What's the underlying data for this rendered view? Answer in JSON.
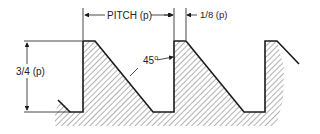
{
  "diagram": {
    "labels": {
      "pitch": "PITCH (p)",
      "flat": "1/8 (p)",
      "depth": "3/4 (p)",
      "angle": "45",
      "angle_unit": "o"
    },
    "geometry": {
      "pitch_px": 91,
      "crest_y": 41,
      "root_y": 112,
      "crest_flat_px": 12,
      "teeth_back_x": [
        83,
        174,
        265
      ]
    },
    "colors": {
      "stroke": "#1a1a1a",
      "hatch": "#555555",
      "background": "#ffffff"
    }
  }
}
